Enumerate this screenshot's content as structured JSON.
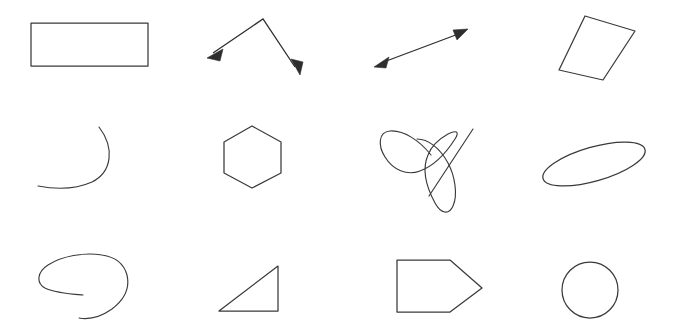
{
  "canvas": {
    "width": 675,
    "height": 330,
    "background_color": "#ffffff",
    "stroke_color": "#3a3a3a",
    "arrow_color": "#2e2e2e",
    "stroke_width": 1.25,
    "grid_rows": 3,
    "grid_columns": 4,
    "shape_count": 12
  },
  "shapes": [
    {
      "index": 1,
      "row": 1,
      "column": 1,
      "name": "rectangle",
      "label": "rectangle",
      "closed": true,
      "geometry": {
        "type": "polygon",
        "points": [
          [
            31,
            23
          ],
          [
            148,
            23
          ],
          [
            148,
            66
          ],
          [
            31,
            66
          ]
        ]
      }
    },
    {
      "index": 2,
      "row": 1,
      "column": 2,
      "name": "double-arrow-angle",
      "label": "double-headed angled arrow",
      "closed": false,
      "geometry": {
        "type": "polyline-arrow",
        "points": [
          [
            209,
            57
          ],
          [
            263,
            19
          ],
          [
            299,
            73
          ]
        ],
        "arrowheads": [
          "start",
          "end"
        ]
      }
    },
    {
      "index": 3,
      "row": 1,
      "column": 3,
      "name": "double-arrow-line",
      "label": "double-headed straight arrow",
      "closed": false,
      "geometry": {
        "type": "line-arrow",
        "points": [
          [
            375,
            66
          ],
          [
            467,
            30
          ]
        ],
        "arrowheads": [
          "start",
          "end"
        ]
      }
    },
    {
      "index": 4,
      "row": 1,
      "column": 4,
      "name": "tilted-quadrilateral",
      "label": "tilted quadrilateral",
      "closed": true,
      "geometry": {
        "type": "polygon",
        "points": [
          [
            585,
            16
          ],
          [
            635,
            31
          ],
          [
            603,
            80
          ],
          [
            559,
            70
          ]
        ]
      }
    },
    {
      "index": 5,
      "row": 2,
      "column": 1,
      "name": "open-arc-curve",
      "label": "open arc curve",
      "closed": false,
      "geometry": {
        "type": "path",
        "d": "M 99 127 C 115 148, 112 172, 92 182 C 74 190, 54 189, 38 186"
      }
    },
    {
      "index": 6,
      "row": 2,
      "column": 2,
      "name": "hexagon",
      "label": "hexagon",
      "closed": true,
      "geometry": {
        "type": "polygon",
        "points": [
          [
            252,
            126
          ],
          [
            281,
            142
          ],
          [
            281,
            173
          ],
          [
            252,
            188
          ],
          [
            224,
            173
          ],
          [
            224,
            142
          ]
        ]
      }
    },
    {
      "index": 7,
      "row": 2,
      "column": 3,
      "name": "scribble-double-loop",
      "label": "scribbled double loop with tail",
      "closed": false,
      "geometry": {
        "type": "path",
        "d": "M 431 155 C 420 141, 404 130, 390 131 C 378 132, 378 146, 385 157 C 393 170, 407 176, 420 171 C 436 165, 448 150, 455 139 C 460 131, 456 130, 448 134 C 439 139, 431 147, 428 155 C 421 171, 428 190, 435 203 C 441 214, 449 215, 453 206 C 458 195, 455 176, 448 163 C 440 148, 428 139, 417 139"
      }
    },
    {
      "index": 8,
      "row": 2,
      "column": 3,
      "name": "scribble-tail-line",
      "label": "diagonal tail stroke",
      "closed": false,
      "geometry": {
        "type": "line",
        "points": [
          [
            473,
            129
          ],
          [
            429,
            196
          ]
        ]
      }
    },
    {
      "index": 9,
      "row": 2,
      "column": 4,
      "name": "tilted-ellipse",
      "label": "tilted narrow ellipse",
      "closed": true,
      "geometry": {
        "type": "ellipse",
        "center": [
          594,
          164
        ],
        "rx": 53,
        "ry": 17,
        "rotation_deg": -16
      }
    },
    {
      "index": 10,
      "row": 3,
      "column": 1,
      "name": "open-spiral-loop",
      "label": "open spiral loop",
      "closed": false,
      "geometry": {
        "type": "path",
        "d": "M 83 295 C 70 294, 55 293, 45 288 C 36 283, 37 272, 48 265 C 62 256, 84 252, 102 255 C 116 257, 124 264, 127 275 C 130 288, 124 300, 112 309 C 102 316, 90 320, 79 318"
      }
    },
    {
      "index": 11,
      "row": 3,
      "column": 2,
      "name": "right-triangle",
      "label": "right triangle",
      "closed": true,
      "geometry": {
        "type": "polygon",
        "points": [
          [
            219,
            311
          ],
          [
            278,
            311
          ],
          [
            278,
            266
          ]
        ]
      }
    },
    {
      "index": 12,
      "row": 3,
      "column": 3,
      "name": "pentagon-arrow-block",
      "label": "right-pointing pentagon block",
      "closed": true,
      "geometry": {
        "type": "polygon",
        "points": [
          [
            397,
            260
          ],
          [
            450,
            260
          ],
          [
            482,
            288
          ],
          [
            450,
            312
          ],
          [
            397,
            312
          ]
        ]
      }
    },
    {
      "index": 13,
      "row": 3,
      "column": 4,
      "name": "circle",
      "label": "circle",
      "closed": true,
      "geometry": {
        "type": "circle",
        "center": [
          590,
          290
        ],
        "r": 28
      }
    }
  ]
}
